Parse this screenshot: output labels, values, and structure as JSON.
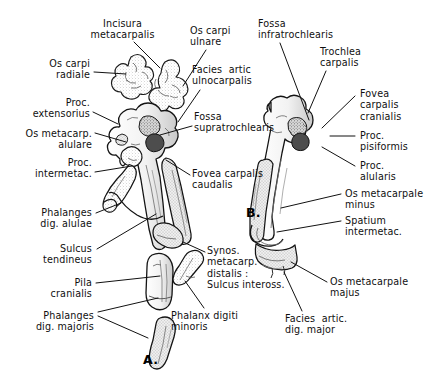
{
  "plate": {
    "title": "Carpometacarpus and digits of the bird wing",
    "background_color": "#ffffff",
    "ink_color": "#111111",
    "width": 444,
    "height": 377
  },
  "figures": [
    {
      "id": "fig-a",
      "label": "A.",
      "x": 143,
      "y": 352
    },
    {
      "id": "fig-b",
      "label": "B.",
      "x": 246,
      "y": 212
    }
  ],
  "labels": [
    {
      "id": "incisura-metacarpalis",
      "lines": [
        "Incisura",
        "metacarpalis"
      ],
      "text": "Incisura metacarpalis",
      "align": "center",
      "x": 75,
      "y": 18,
      "w": 95,
      "leader": [
        [
          134,
          42
        ],
        [
          160,
          68
        ]
      ]
    },
    {
      "id": "os-carpi-ulnare",
      "lines": [
        "Os carpi",
        "ulnare"
      ],
      "text": "Os carpi ulnare",
      "align": "left",
      "x": 190,
      "y": 25,
      "w": 60,
      "leader": [
        [
          206,
          50
        ],
        [
          183,
          86
        ]
      ]
    },
    {
      "id": "fossa-infratrochlearis",
      "lines": [
        "Fossa",
        "infratrochlearis"
      ],
      "text": "Fossa infratrochlearis",
      "align": "left",
      "x": 258,
      "y": 18,
      "w": 84,
      "leader": [
        [
          280,
          43
        ],
        [
          309,
          120
        ]
      ]
    },
    {
      "id": "trochlea-carpalis",
      "lines": [
        "Trochlea",
        "carpalis"
      ],
      "text": "Trochlea carpalis",
      "align": "left",
      "x": 320,
      "y": 46,
      "w": 66,
      "leader": [
        [
          326,
          71
        ],
        [
          308,
          113
        ]
      ]
    },
    {
      "id": "os-carpi-radiale",
      "lines": [
        "Os carpi",
        "radiale"
      ],
      "text": "Os carpi radiale",
      "align": "right",
      "x": 14,
      "y": 58,
      "w": 76,
      "leader": [
        [
          94,
          72
        ],
        [
          126,
          74
        ]
      ]
    },
    {
      "id": "facies-artic-ulnocarpalis",
      "lines": [
        "Facies  artic",
        "ulnocarpalis"
      ],
      "text": "Facies artic ulnocarpalis",
      "align": "left",
      "x": 192,
      "y": 64,
      "w": 84,
      "leader": [
        [
          200,
          90
        ],
        [
          178,
          122
        ]
      ]
    },
    {
      "id": "fovea-carpalis-cranialis",
      "lines": [
        "Fovea",
        "carpalis",
        "cranialis"
      ],
      "text": "Fovea carpalis cranialis",
      "align": "left",
      "x": 360,
      "y": 88,
      "w": 62,
      "leader": [
        [
          355,
          96
        ],
        [
          322,
          128
        ]
      ]
    },
    {
      "id": "proc-extensorius",
      "lines": [
        "Proc.",
        "extensorius"
      ],
      "text": "Proc. extensorius",
      "align": "right",
      "x": 8,
      "y": 97,
      "w": 82,
      "leader": [
        [
          93,
          112
        ],
        [
          118,
          124
        ]
      ]
    },
    {
      "id": "fossa-supratrochlearis",
      "lines": [
        "Fossa",
        "supratrochlearis"
      ],
      "text": "Fossa supratrochlearis",
      "align": "left",
      "x": 194,
      "y": 111,
      "w": 92,
      "leader": [
        [
          192,
          126
        ],
        [
          160,
          135
        ]
      ]
    },
    {
      "id": "proc-pisiformis",
      "lines": [
        "Proc.",
        "pisiformis"
      ],
      "text": "Proc. pisiformis",
      "align": "left",
      "x": 360,
      "y": 130,
      "w": 62,
      "leader": [
        [
          355,
          136
        ],
        [
          330,
          136
        ]
      ]
    },
    {
      "id": "os-metacarp-alulare",
      "lines": [
        "Os metacarp.",
        "alulare"
      ],
      "text": "Os metacarp. alulare",
      "align": "right",
      "x": 6,
      "y": 128,
      "w": 86,
      "leader": [
        [
          95,
          133
        ],
        [
          126,
          142
        ]
      ]
    },
    {
      "id": "proc-alularis",
      "lines": [
        "Proc.",
        "alularis"
      ],
      "text": "Proc. alularis",
      "align": "left",
      "x": 360,
      "y": 160,
      "w": 58,
      "leader": [
        [
          355,
          166
        ],
        [
          322,
          147
        ]
      ]
    },
    {
      "id": "proc-intermetac",
      "lines": [
        "Proc.",
        "intermetac."
      ],
      "text": "Proc. intermetac.",
      "align": "right",
      "x": 8,
      "y": 157,
      "w": 84,
      "leader": [
        [
          95,
          172
        ],
        [
          132,
          166
        ]
      ]
    },
    {
      "id": "fovea-carpalis-caudalis",
      "lines": [
        "Fovea carpalis",
        "caudalis"
      ],
      "text": "Fovea carpalis caudalis",
      "align": "left",
      "x": 192,
      "y": 168,
      "w": 80,
      "leader": [
        [
          190,
          175
        ],
        [
          166,
          160
        ]
      ]
    },
    {
      "id": "os-metacarpale-minus",
      "lines": [
        "Os metacarpale",
        "minus"
      ],
      "text": "Os metacarpale minus",
      "align": "left",
      "x": 345,
      "y": 188,
      "w": 92,
      "leader": [
        [
          341,
          194
        ],
        [
          281,
          208
        ]
      ]
    },
    {
      "id": "spatium-intermetac",
      "lines": [
        "Spatium",
        "intermetac."
      ],
      "text": "Spatium intermetac.",
      "align": "left",
      "x": 345,
      "y": 215,
      "w": 72,
      "leader": [
        [
          341,
          221
        ],
        [
          277,
          232
        ]
      ]
    },
    {
      "id": "phalanges-dig-alulae",
      "lines": [
        "Phalanges",
        "dig. alulae"
      ],
      "text": "Phalanges dig. alulae",
      "align": "right",
      "x": 8,
      "y": 207,
      "w": 84,
      "leader": [
        [
          96,
          213
        ],
        [
          121,
          203
        ]
      ]
    },
    {
      "id": "sulcus-tendineus",
      "lines": [
        "Sulcus",
        "tendineus"
      ],
      "text": "Sulcus tendineus",
      "align": "right",
      "x": 14,
      "y": 243,
      "w": 78,
      "leader": [
        [
          97,
          249
        ],
        [
          156,
          214
        ]
      ]
    },
    {
      "id": "synos-metacarp-distalis",
      "lines": [
        "Synos.",
        "metacarp.",
        "distalis :",
        "Sulcus inteross."
      ],
      "text": "Synos. metacarp. distalis : Sulcus inteross.",
      "align": "left",
      "x": 207,
      "y": 245,
      "w": 96,
      "leader": [
        [
          205,
          252
        ],
        [
          183,
          242
        ]
      ]
    },
    {
      "id": "pila-cranialis",
      "lines": [
        "Pila",
        "cranialis"
      ],
      "text": "Pila cranialis",
      "align": "right",
      "x": 20,
      "y": 277,
      "w": 72,
      "leader": [
        [
          96,
          283
        ],
        [
          160,
          276
        ]
      ]
    },
    {
      "id": "os-metacarpale-majus",
      "lines": [
        "Os metacarpale",
        "majus"
      ],
      "text": "Os metacarpale majus",
      "align": "left",
      "x": 330,
      "y": 276,
      "w": 92,
      "leader": [
        [
          327,
          282
        ],
        [
          291,
          262
        ]
      ]
    },
    {
      "id": "phalanges-dig-majoris",
      "lines": [
        "Phalanges",
        "dig. majoris"
      ],
      "text": "Phalanges dig. majoris",
      "align": "right",
      "x": 6,
      "y": 310,
      "w": 88,
      "leader": [
        [
          98,
          312
        ],
        [
          158,
          298
        ]
      ],
      "leader2": [
        [
          98,
          316
        ],
        [
          148,
          338
        ]
      ]
    },
    {
      "id": "phalanx-digiti-minoris",
      "lines": [
        "Phalanx digiti",
        "minoris"
      ],
      "text": "Phalanx digiti minoris",
      "align": "left",
      "x": 171,
      "y": 310,
      "w": 84,
      "leader": [
        [
          204,
          308
        ],
        [
          185,
          281
        ]
      ]
    },
    {
      "id": "facies-artic-dig-major",
      "lines": [
        "Facies  artic.",
        "dig. major"
      ],
      "text": "Facies artic. dig. major",
      "align": "left",
      "x": 285,
      "y": 313,
      "w": 82,
      "leader": [
        [
          302,
          311
        ],
        [
          284,
          272
        ]
      ]
    }
  ]
}
